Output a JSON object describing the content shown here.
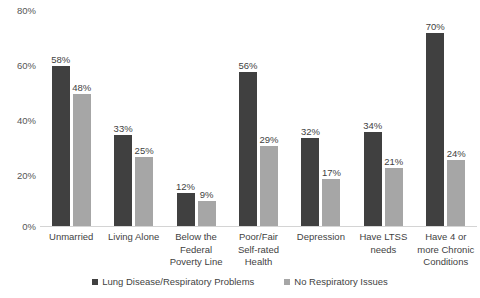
{
  "chart_data": {
    "type": "bar",
    "title": "",
    "subtitle": "",
    "xlabel": "",
    "ylabel": "",
    "ylim": [
      0,
      80
    ],
    "y_ticks": [
      "0%",
      "20%",
      "40%",
      "60%",
      "80%"
    ],
    "y_tick_values": [
      0,
      20,
      40,
      60,
      80
    ],
    "grid": false,
    "legend_position": "bottom",
    "value_suffix": "%",
    "categories": [
      "Unmarried",
      "Living Alone",
      "Below the Federal Poverty Line",
      "Poor/Fair Self-rated Health",
      "Depression",
      "Have LTSS needs",
      "Have 4 or more Chronic Conditions"
    ],
    "series": [
      {
        "name": "Lung Disease/Respiratory Problems",
        "color": "#404040",
        "values": [
          58,
          33,
          12,
          56,
          32,
          34,
          70
        ],
        "labels": [
          "58%",
          "33%",
          "12%",
          "56%",
          "32%",
          "34%",
          "70%"
        ]
      },
      {
        "name": "No Respiratory Issues",
        "color": "#a6a6a6",
        "values": [
          48,
          25,
          9,
          29,
          17,
          21,
          24
        ],
        "labels": [
          "48%",
          "25%",
          "9%",
          "29%",
          "17%",
          "21%",
          "24%"
        ]
      }
    ]
  }
}
